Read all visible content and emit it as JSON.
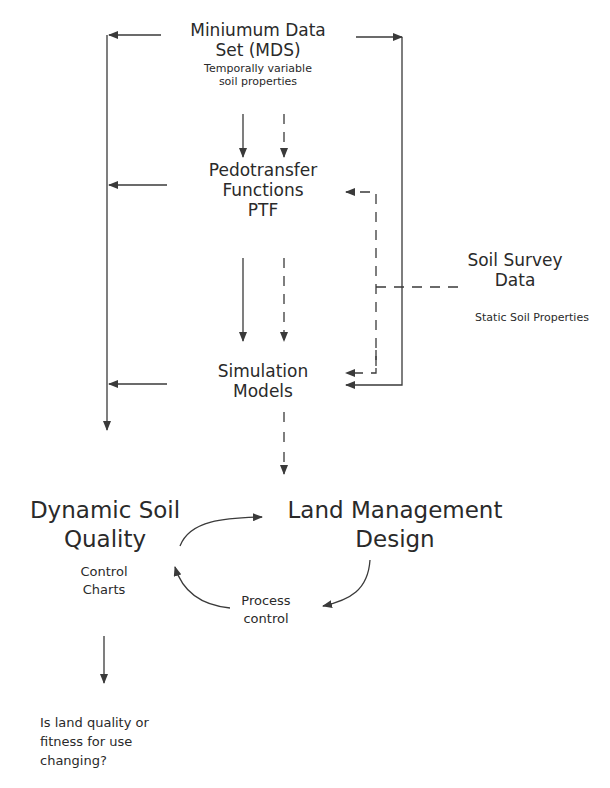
{
  "nodes": {
    "mds": {
      "line1": "Miniumum Data",
      "line2": "Set  (MDS)",
      "sub1": "Temporally variable",
      "sub2": "soil properties"
    },
    "ptf": {
      "line1": "Pedotransfer",
      "line2": "Functions",
      "line3": "PTF"
    },
    "soil_survey": {
      "line1": "Soil Survey",
      "line2": "Data",
      "sub": "Static Soil Properties"
    },
    "simulation": {
      "line1": "Simulation",
      "line2": "Models"
    },
    "dsq": {
      "line1": "Dynamic Soil",
      "line2": "Quality",
      "sub1": "Control",
      "sub2": "Charts"
    },
    "lmd": {
      "line1": "Land Management",
      "line2": "Design"
    },
    "process": {
      "line1": "Process",
      "line2": "control"
    },
    "question": {
      "line1": "Is land quality or",
      "line2": "fitness for use",
      "line3": "changing?"
    }
  },
  "colors": {
    "line": "#3a3a3a",
    "text": "#2a2a2a",
    "background": "#ffffff"
  }
}
